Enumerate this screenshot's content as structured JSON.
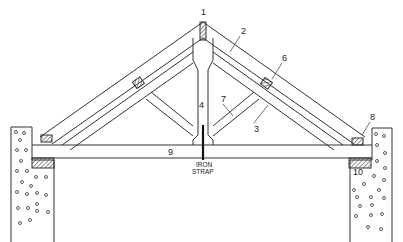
{
  "diagram": {
    "labels": [
      {
        "id": "1",
        "text": "1",
        "x": 203,
        "y": 14
      },
      {
        "id": "2",
        "text": "2",
        "x": 243,
        "y": 33
      },
      {
        "id": "3",
        "text": "3",
        "x": 256,
        "y": 128
      },
      {
        "id": "4",
        "text": "4",
        "x": 201,
        "y": 107
      },
      {
        "id": "6",
        "text": "6",
        "x": 284,
        "y": 60
      },
      {
        "id": "7",
        "text": "7",
        "x": 223,
        "y": 101
      },
      {
        "id": "8",
        "text": "8",
        "x": 372,
        "y": 119
      },
      {
        "id": "9",
        "text": "9",
        "x": 170,
        "y": 155
      },
      {
        "id": "10",
        "text": "10",
        "x": 353,
        "y": 175
      }
    ],
    "strap_label_line1": "IRON",
    "strap_label_line2": "STRAP",
    "colors": {
      "line": "#333333",
      "hatch": "#444444",
      "background": "#ffffff"
    }
  }
}
